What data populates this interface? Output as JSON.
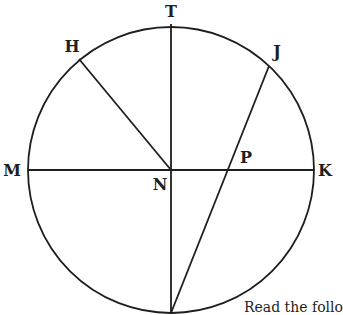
{
  "diagram": {
    "type": "circle-geometry",
    "stroke_color": "#1e1e1e",
    "circle": {
      "center": "N",
      "cx": 171,
      "cy": 170,
      "r": 143
    },
    "points": [
      {
        "id": "T",
        "x": 171,
        "y": 24,
        "label_x": 171,
        "label_y": 17
      },
      {
        "id": "H",
        "x": 79,
        "y": 59,
        "label_x": 72,
        "label_y": 52
      },
      {
        "id": "J",
        "x": 269,
        "y": 66,
        "label_x": 277,
        "label_y": 57
      },
      {
        "id": "M",
        "x": 28,
        "y": 170,
        "label_x": 12,
        "label_y": 176
      },
      {
        "id": "K",
        "x": 314,
        "y": 170,
        "label_x": 325,
        "label_y": 176
      },
      {
        "id": "N",
        "x": 171,
        "y": 170,
        "label_x": 160,
        "label_y": 190
      },
      {
        "id": "P",
        "x": 226,
        "y": 170,
        "label_x": 246,
        "label_y": 163
      }
    ],
    "segments": [
      {
        "name": "MK",
        "from": "M",
        "to": "K"
      },
      {
        "name": "T-bottom",
        "from": "T",
        "to": "bottom"
      },
      {
        "name": "HN",
        "from": "H",
        "to": "N"
      },
      {
        "name": "J-bottom",
        "from": "J",
        "to": "bottom"
      }
    ],
    "bottom_point": {
      "x": 171,
      "y": 313
    },
    "labels": {
      "T": "T",
      "H": "H",
      "J": "J",
      "M": "M",
      "K": "K",
      "N": "N",
      "P": "P"
    }
  },
  "caption": "Read the follo"
}
